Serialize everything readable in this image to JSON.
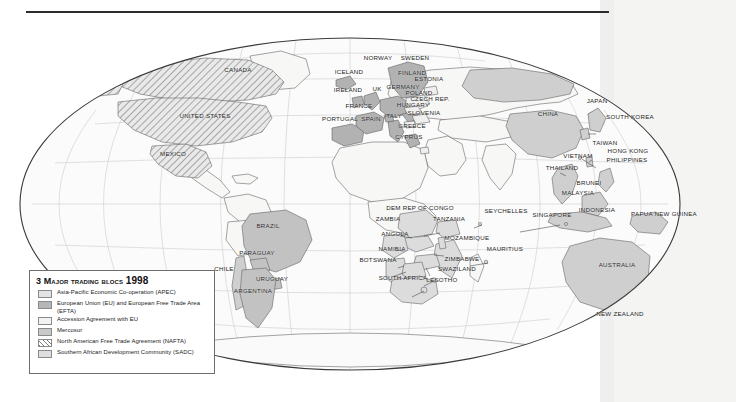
{
  "page": {
    "background_color": "#ffffff",
    "right_band_color": "#efefef",
    "rule_color": "#2b2b2b"
  },
  "legend": {
    "title_prefix": "3 ",
    "title_main": "Major trading blocs ",
    "title_year": "1998",
    "title_full": "3 Major trading blocs 1998",
    "items": [
      {
        "swatch": "apec",
        "color": "#e3e3e3",
        "label": "Asia-Pacific Economic Co-operation (APEC)"
      },
      {
        "swatch": "eu",
        "color": "#b6b6b6",
        "label": "European Union (EU) and European Free Trade Area (EFTA)"
      },
      {
        "swatch": "acc",
        "color": "#f2f2f2",
        "label": "Accession Agreement with EU"
      },
      {
        "swatch": "merc",
        "color": "#c9c9c9",
        "label": "Mercosur"
      },
      {
        "swatch": "nafta",
        "color": "#7d7d7d",
        "label": "North American Free Trade Agreement (NAFTA)"
      },
      {
        "swatch": "sadc",
        "color": "#dedede",
        "label": "Southern African Development Community (SADC)"
      }
    ]
  },
  "map": {
    "projection": "mollweide-style oval world map",
    "ocean_color": "#fbfbfb",
    "land_color": "#f6f6f6",
    "graticule_color": "#c9c9c9",
    "coast_color": "#555555",
    "outline_color": "#3a3a3a",
    "labels": [
      {
        "name": "canada",
        "text": "CANADA",
        "x": 238,
        "y": 69
      },
      {
        "name": "united-states",
        "text": "UNITED STATES",
        "x": 205,
        "y": 115
      },
      {
        "name": "mexico",
        "text": "MEXICO",
        "x": 173,
        "y": 153
      },
      {
        "name": "brazil",
        "text": "BRAZIL",
        "x": 268,
        "y": 225
      },
      {
        "name": "paraguay",
        "text": "PARAGUAY",
        "x": 257,
        "y": 252
      },
      {
        "name": "chile",
        "text": "CHILE",
        "x": 224,
        "y": 268
      },
      {
        "name": "uruguay",
        "text": "URUGUAY",
        "x": 272,
        "y": 278
      },
      {
        "name": "argentina",
        "text": "ARGENTINA",
        "x": 253,
        "y": 290
      },
      {
        "name": "iceland",
        "text": "ICELAND",
        "x": 349,
        "y": 71
      },
      {
        "name": "norway",
        "text": "NORWAY",
        "x": 378,
        "y": 57
      },
      {
        "name": "sweden",
        "text": "SWEDEN",
        "x": 415,
        "y": 57
      },
      {
        "name": "finland",
        "text": "FINLAND",
        "x": 412,
        "y": 72
      },
      {
        "name": "estonia",
        "text": "ESTONIA",
        "x": 429,
        "y": 78
      },
      {
        "name": "ireland",
        "text": "IRELAND",
        "x": 348,
        "y": 89
      },
      {
        "name": "uk",
        "text": "UK",
        "x": 377,
        "y": 88
      },
      {
        "name": "germany",
        "text": "GERMANY",
        "x": 403,
        "y": 86
      },
      {
        "name": "poland",
        "text": "POLAND",
        "x": 419,
        "y": 92
      },
      {
        "name": "czech-rep",
        "text": "CZECH REP.",
        "x": 430,
        "y": 98
      },
      {
        "name": "france",
        "text": "FRANCE",
        "x": 359,
        "y": 105
      },
      {
        "name": "hungary",
        "text": "HUNGARY",
        "x": 413,
        "y": 104
      },
      {
        "name": "slovenia",
        "text": "SLOVENIA",
        "x": 424,
        "y": 112
      },
      {
        "name": "portugal",
        "text": "PORTUGAL",
        "x": 340,
        "y": 118
      },
      {
        "name": "spain",
        "text": "SPAIN",
        "x": 371,
        "y": 118
      },
      {
        "name": "italy",
        "text": "ITALY",
        "x": 393,
        "y": 115
      },
      {
        "name": "greece",
        "text": "GREECE",
        "x": 412,
        "y": 125
      },
      {
        "name": "cyprus",
        "text": "CYPRUS",
        "x": 409,
        "y": 136
      },
      {
        "name": "china",
        "text": "CHINA",
        "x": 548,
        "y": 113
      },
      {
        "name": "japan",
        "text": "JAPAN",
        "x": 597,
        "y": 100
      },
      {
        "name": "south-korea",
        "text": "SOUTH KOREA",
        "x": 630,
        "y": 116
      },
      {
        "name": "taiwan",
        "text": "TAIWAN",
        "x": 605,
        "y": 142
      },
      {
        "name": "hong-kong",
        "text": "HONG KONG",
        "x": 628,
        "y": 150
      },
      {
        "name": "vietnam",
        "text": "VIETNAM",
        "x": 578,
        "y": 155
      },
      {
        "name": "philippines",
        "text": "PHILIPPINES",
        "x": 627,
        "y": 159
      },
      {
        "name": "thailand",
        "text": "THAILAND",
        "x": 562,
        "y": 167
      },
      {
        "name": "brunei",
        "text": "BRUNEI",
        "x": 589,
        "y": 182
      },
      {
        "name": "malaysia",
        "text": "MALAYSIA",
        "x": 578,
        "y": 192
      },
      {
        "name": "singapore",
        "text": "SINGAPORE",
        "x": 552,
        "y": 214
      },
      {
        "name": "indonesia",
        "text": "INDONESIA",
        "x": 597,
        "y": 209
      },
      {
        "name": "papua-new-guinea",
        "text": "PAPUA NEW GUINEA",
        "x": 664,
        "y": 213
      },
      {
        "name": "australia",
        "text": "AUSTRALIA",
        "x": 617,
        "y": 264
      },
      {
        "name": "new-zealand",
        "text": "NEW ZEALAND",
        "x": 620,
        "y": 313
      },
      {
        "name": "dem-rep-congo",
        "text": "DEM REP OF CONGO",
        "x": 420,
        "y": 207
      },
      {
        "name": "zambia",
        "text": "ZAMBIA",
        "x": 388,
        "y": 218
      },
      {
        "name": "tanzania",
        "text": "TANZANIA",
        "x": 449,
        "y": 218
      },
      {
        "name": "seychelles",
        "text": "SEYCHELLES",
        "x": 506,
        "y": 210
      },
      {
        "name": "angola",
        "text": "ANGOLA",
        "x": 395,
        "y": 233
      },
      {
        "name": "mozambique",
        "text": "MOZAMBIQUE",
        "x": 467,
        "y": 237
      },
      {
        "name": "namibia",
        "text": "NAMIBIA",
        "x": 392,
        "y": 248
      },
      {
        "name": "mauritius",
        "text": "MAURITIUS",
        "x": 505,
        "y": 248
      },
      {
        "name": "botswana",
        "text": "BOTSWANA",
        "x": 378,
        "y": 259
      },
      {
        "name": "zimbabwe",
        "text": "ZIMBABWE",
        "x": 462,
        "y": 258
      },
      {
        "name": "swaziland",
        "text": "SWAZILAND",
        "x": 457,
        "y": 268
      },
      {
        "name": "south-africa",
        "text": "SOUTH AFRICA",
        "x": 403,
        "y": 277
      },
      {
        "name": "lesotho",
        "text": "LESOTHO",
        "x": 442,
        "y": 279
      }
    ]
  }
}
